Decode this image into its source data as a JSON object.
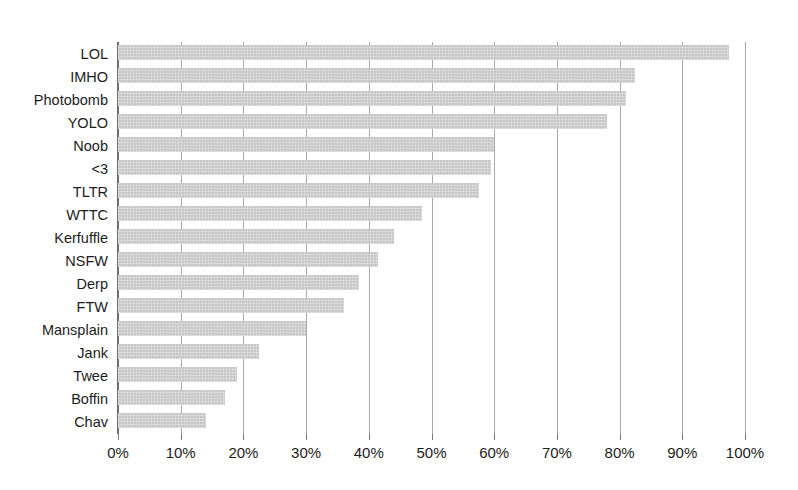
{
  "chart_data": {
    "type": "bar",
    "orientation": "horizontal",
    "title": "",
    "xlabel": "",
    "ylabel": "",
    "xlim": [
      0,
      100
    ],
    "xtick_step": 10,
    "xticks": [
      0,
      10,
      20,
      30,
      40,
      50,
      60,
      70,
      80,
      90,
      100
    ],
    "xtick_labels": [
      "0%",
      "10%",
      "20%",
      "30%",
      "40%",
      "50%",
      "60%",
      "70%",
      "80%",
      "90%",
      "100%"
    ],
    "grid": "vertical-only",
    "legend": "none",
    "value_unit": "%",
    "bar_color": "#c6c6c6",
    "gridline_color": "#a9a9a9",
    "axis_color": "#6e6e6e",
    "text_color": "#1c1c1c",
    "categories": [
      "LOL",
      "IMHO",
      "Photobomb",
      "YOLO",
      "Noob",
      "<3",
      "TLTR",
      "WTTC",
      "Kerfuffle",
      "NSFW",
      "Derp",
      "FTW",
      "Mansplain",
      "Jank",
      "Twee",
      "Boffin",
      "Chav"
    ],
    "values": [
      97.5,
      82.5,
      81,
      78,
      60,
      59.5,
      57.5,
      48.5,
      44,
      41.5,
      38.5,
      36,
      30,
      22.5,
      19,
      17,
      14
    ],
    "points": [
      {
        "category": "LOL",
        "value": 97.5
      },
      {
        "category": "IMHO",
        "value": 82.5
      },
      {
        "category": "Photobomb",
        "value": 81
      },
      {
        "category": "YOLO",
        "value": 78
      },
      {
        "category": "Noob",
        "value": 60
      },
      {
        "category": "<3",
        "value": 59.5
      },
      {
        "category": "TLTR",
        "value": 57.5
      },
      {
        "category": "WTTC",
        "value": 48.5
      },
      {
        "category": "Kerfuffle",
        "value": 44
      },
      {
        "category": "NSFW",
        "value": 41.5
      },
      {
        "category": "Derp",
        "value": 38.5
      },
      {
        "category": "FTW",
        "value": 36
      },
      {
        "category": "Mansplain",
        "value": 30
      },
      {
        "category": "Jank",
        "value": 22.5
      },
      {
        "category": "Twee",
        "value": 19
      },
      {
        "category": "Boffin",
        "value": 17
      },
      {
        "category": "Chav",
        "value": 14
      }
    ]
  }
}
